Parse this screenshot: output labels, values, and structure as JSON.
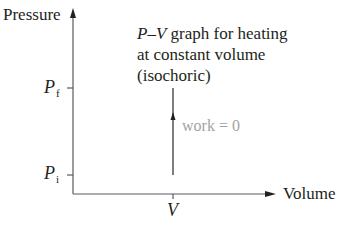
{
  "diagram": {
    "title": {
      "line1_italic": "P–V",
      "line1_rest": " graph for heating",
      "line2": "at constant volume",
      "line3": "(isochoric)"
    },
    "axes": {
      "y_label": "Pressure",
      "x_label": "Volume"
    },
    "ticks": {
      "p_final": {
        "symbol": "P",
        "subscript": "f"
      },
      "p_initial": {
        "symbol": "P",
        "subscript": "i"
      },
      "volume": {
        "symbol": "V"
      }
    },
    "process": {
      "annotation": "work = 0",
      "direction": "up",
      "from": "P_i",
      "to": "P_f",
      "at_volume": "V"
    },
    "colors": {
      "ink": "#231f20",
      "annotation": "#a3a3a3",
      "axis": "#5a5a5a"
    }
  }
}
